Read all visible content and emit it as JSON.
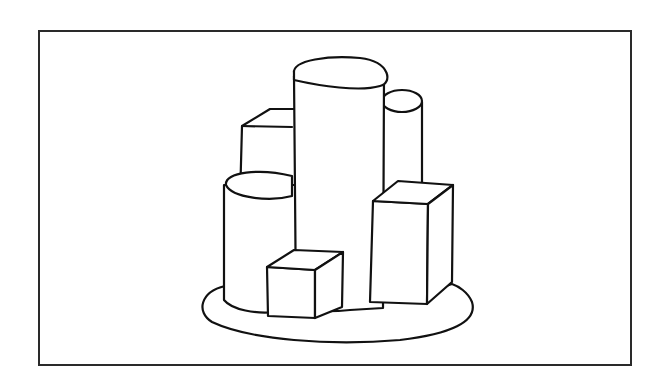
{
  "figure": {
    "caption": "",
    "colors": {
      "stroke": "#111111",
      "background": "#ffffff",
      "frame": "#2a2a2a"
    },
    "objects": [
      {
        "id": "base",
        "shape": "oval-platform"
      },
      {
        "id": "tall-center-cylinder",
        "shape": "cylinder"
      },
      {
        "id": "back-right-cylinder",
        "shape": "cylinder"
      },
      {
        "id": "front-left-cylinder",
        "shape": "cylinder"
      },
      {
        "id": "back-left-box",
        "shape": "rectangular-box"
      },
      {
        "id": "right-tall-box",
        "shape": "rectangular-box"
      },
      {
        "id": "front-small-cube",
        "shape": "cube"
      }
    ]
  }
}
